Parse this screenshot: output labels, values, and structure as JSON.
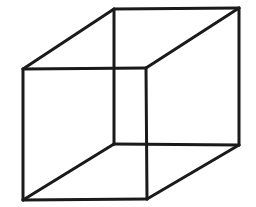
{
  "diagram": {
    "type": "necker-cube-wireframe",
    "stroke_color": "#1a1a1a",
    "background": "#ffffff",
    "vertices": {
      "front_tl": [
        23,
        69
      ],
      "front_tr": [
        146,
        68
      ],
      "front_br": [
        147,
        199
      ],
      "front_bl": [
        23,
        200
      ],
      "back_tl": [
        114,
        9
      ],
      "back_tr": [
        239,
        8
      ],
      "back_br": [
        239,
        145
      ],
      "back_bl": [
        114,
        144
      ]
    },
    "edges": [
      [
        "front_tl",
        "front_tr"
      ],
      [
        "front_tr",
        "front_br"
      ],
      [
        "front_br",
        "front_bl"
      ],
      [
        "front_bl",
        "front_tl"
      ],
      [
        "back_tl",
        "back_tr"
      ],
      [
        "back_tr",
        "back_br"
      ],
      [
        "back_br",
        "back_bl"
      ],
      [
        "back_bl",
        "back_tl"
      ],
      [
        "front_tl",
        "back_tl"
      ],
      [
        "front_tr",
        "back_tr"
      ],
      [
        "front_br",
        "back_br"
      ],
      [
        "front_bl",
        "back_bl"
      ]
    ]
  }
}
